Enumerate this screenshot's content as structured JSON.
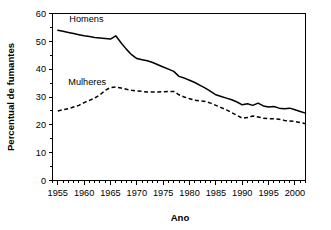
{
  "chart_data": {
    "type": "line",
    "title": "",
    "xlabel": "Ano",
    "ylabel": "Percentual de fumantes",
    "xlim": [
      1954,
      2002
    ],
    "ylim": [
      0,
      60
    ],
    "grid": false,
    "legend_position": "inline-annotation",
    "x_ticks": [
      1955,
      1960,
      1965,
      1970,
      1975,
      1980,
      1985,
      1990,
      1995,
      2000
    ],
    "x_tick_labels": [
      "1955",
      "1960",
      "1965",
      "1970",
      "1975",
      "1980",
      "1985",
      "1990",
      "1995",
      "2000"
    ],
    "x_minor_tick_step": 1,
    "y_ticks": [
      0,
      10,
      20,
      30,
      40,
      50,
      60
    ],
    "y_tick_labels": [
      "0",
      "10",
      "20",
      "30",
      "40",
      "50",
      "60"
    ],
    "y_minor_tick_step": 5,
    "x": [
      1955,
      1956,
      1957,
      1958,
      1959,
      1960,
      1961,
      1962,
      1963,
      1964,
      1965,
      1966,
      1967,
      1968,
      1969,
      1970,
      1971,
      1972,
      1973,
      1974,
      1975,
      1976,
      1977,
      1978,
      1979,
      1980,
      1981,
      1982,
      1983,
      1984,
      1985,
      1986,
      1987,
      1988,
      1989,
      1990,
      1991,
      1992,
      1993,
      1994,
      1995,
      1996,
      1997,
      1998,
      1999,
      2000,
      2001,
      2002
    ],
    "series": [
      {
        "name": "Homens",
        "style": "solid",
        "color": "#000000",
        "values": [
          54.0,
          53.6,
          53.2,
          52.8,
          52.4,
          52.0,
          51.7,
          51.4,
          51.2,
          51.0,
          50.8,
          52.0,
          49.5,
          47.2,
          45.2,
          43.8,
          43.4,
          43.0,
          42.4,
          41.6,
          40.8,
          40.0,
          39.2,
          37.4,
          36.8,
          36.0,
          35.2,
          34.2,
          33.2,
          32.0,
          30.8,
          30.2,
          29.6,
          29.0,
          28.2,
          27.2,
          27.6,
          27.0,
          27.8,
          26.8,
          26.4,
          26.6,
          26.0,
          25.8,
          26.0,
          25.4,
          24.8,
          24.2
        ],
        "label_position": {
          "x": 1957.2,
          "y": 57.0
        }
      },
      {
        "name": "Mulheres",
        "style": "dashed",
        "color": "#000000",
        "values": [
          25.0,
          25.4,
          25.8,
          26.4,
          27.0,
          28.0,
          28.8,
          29.6,
          30.8,
          32.4,
          33.4,
          33.6,
          33.2,
          32.8,
          32.4,
          32.2,
          32.0,
          31.8,
          31.8,
          31.8,
          31.9,
          32.0,
          32.0,
          30.8,
          30.0,
          29.4,
          28.8,
          28.6,
          28.4,
          27.8,
          27.0,
          26.2,
          25.4,
          24.4,
          23.4,
          22.4,
          22.6,
          23.2,
          22.8,
          22.4,
          22.2,
          22.2,
          22.0,
          21.6,
          21.4,
          21.2,
          20.8,
          20.4
        ],
        "label_position": {
          "x": 1957.0,
          "y": 34.2
        }
      }
    ]
  },
  "axes": {
    "x_title": "Ano",
    "y_title": "Percentual de fumantes"
  },
  "annotations": {
    "homens_label": "Homens",
    "mulheres_label": "Mulheres"
  }
}
